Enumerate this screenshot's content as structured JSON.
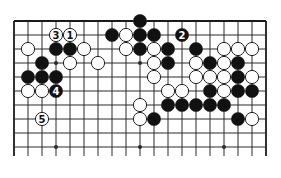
{
  "diagram": {
    "type": "go-board-fragment",
    "grid": {
      "origin_x": 14,
      "origin_y": 21,
      "spacing": 14,
      "cols": 19,
      "rows": 10,
      "open_bottom": true,
      "line_color": "#2a2a2a",
      "edge_color": "#1a1a1a"
    },
    "star_points": [
      {
        "c": 3,
        "r": 3
      },
      {
        "c": 9,
        "r": 3
      },
      {
        "c": 3,
        "r": 9
      },
      {
        "c": 9,
        "r": 9
      },
      {
        "c": 15,
        "r": 9
      }
    ],
    "colors": {
      "black_stone": "#111111",
      "white_stone": "#ffffff",
      "stone_outline": "#222222"
    },
    "stones": [
      {
        "color": "black",
        "c": 9,
        "r": 0
      },
      {
        "color": "white",
        "c": 3,
        "r": 1,
        "label": "3"
      },
      {
        "color": "white",
        "c": 4,
        "r": 1,
        "label": "1"
      },
      {
        "color": "black",
        "c": 7,
        "r": 1
      },
      {
        "color": "white",
        "c": 8,
        "r": 1
      },
      {
        "color": "black",
        "c": 9,
        "r": 1
      },
      {
        "color": "black",
        "c": 10,
        "r": 1
      },
      {
        "color": "black",
        "c": 12,
        "r": 1,
        "label": "2"
      },
      {
        "color": "white",
        "c": 1,
        "r": 2
      },
      {
        "color": "black",
        "c": 3,
        "r": 2
      },
      {
        "color": "black",
        "c": 4,
        "r": 2
      },
      {
        "color": "white",
        "c": 5,
        "r": 2
      },
      {
        "color": "white",
        "c": 8,
        "r": 2
      },
      {
        "color": "black",
        "c": 9,
        "r": 2
      },
      {
        "color": "white",
        "c": 10,
        "r": 2
      },
      {
        "color": "black",
        "c": 11,
        "r": 2
      },
      {
        "color": "black",
        "c": 13,
        "r": 2
      },
      {
        "color": "white",
        "c": 15,
        "r": 2
      },
      {
        "color": "white",
        "c": 16,
        "r": 2
      },
      {
        "color": "white",
        "c": 17,
        "r": 2
      },
      {
        "color": "black",
        "c": 2,
        "r": 3
      },
      {
        "color": "white",
        "c": 4,
        "r": 3
      },
      {
        "color": "white",
        "c": 6,
        "r": 3
      },
      {
        "color": "white",
        "c": 10,
        "r": 3
      },
      {
        "color": "black",
        "c": 11,
        "r": 3
      },
      {
        "color": "white",
        "c": 13,
        "r": 3
      },
      {
        "color": "black",
        "c": 14,
        "r": 3
      },
      {
        "color": "white",
        "c": 15,
        "r": 3
      },
      {
        "color": "black",
        "c": 16,
        "r": 3
      },
      {
        "color": "black",
        "c": 1,
        "r": 4
      },
      {
        "color": "black",
        "c": 2,
        "r": 4
      },
      {
        "color": "black",
        "c": 3,
        "r": 4
      },
      {
        "color": "white",
        "c": 10,
        "r": 4
      },
      {
        "color": "white",
        "c": 13,
        "r": 4
      },
      {
        "color": "white",
        "c": 14,
        "r": 4
      },
      {
        "color": "white",
        "c": 15,
        "r": 4
      },
      {
        "color": "black",
        "c": 16,
        "r": 4
      },
      {
        "color": "white",
        "c": 17,
        "r": 4
      },
      {
        "color": "white",
        "c": 1,
        "r": 5
      },
      {
        "color": "white",
        "c": 2,
        "r": 5
      },
      {
        "color": "black",
        "c": 3,
        "r": 5,
        "label": "4"
      },
      {
        "color": "white",
        "c": 11,
        "r": 5
      },
      {
        "color": "white",
        "c": 12,
        "r": 5
      },
      {
        "color": "black",
        "c": 14,
        "r": 5
      },
      {
        "color": "white",
        "c": 15,
        "r": 5
      },
      {
        "color": "black",
        "c": 16,
        "r": 5
      },
      {
        "color": "black",
        "c": 17,
        "r": 5
      },
      {
        "color": "white",
        "c": 9,
        "r": 6
      },
      {
        "color": "black",
        "c": 11,
        "r": 6
      },
      {
        "color": "black",
        "c": 12,
        "r": 6
      },
      {
        "color": "black",
        "c": 13,
        "r": 6
      },
      {
        "color": "black",
        "c": 14,
        "r": 6
      },
      {
        "color": "black",
        "c": 15,
        "r": 6
      },
      {
        "color": "white",
        "c": 2,
        "r": 7,
        "label": "5"
      },
      {
        "color": "white",
        "c": 9,
        "r": 7
      },
      {
        "color": "black",
        "c": 10,
        "r": 7
      },
      {
        "color": "black",
        "c": 16,
        "r": 7
      },
      {
        "color": "white",
        "c": 17,
        "r": 7
      }
    ],
    "move_labels": [
      "1",
      "2",
      "3",
      "4",
      "5"
    ]
  }
}
